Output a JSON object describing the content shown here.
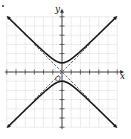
{
  "chart_data": {
    "type": "line",
    "title": "",
    "xlabel": "x",
    "ylabel": "y",
    "origin_label": "O",
    "xlim": [
      -6,
      6
    ],
    "ylim": [
      -6,
      6
    ],
    "grid": true,
    "tick_step": 1,
    "series": [
      {
        "name": "hyperbola upper branch",
        "equation": "y^2 - x^2 = 1",
        "branch": "upper",
        "style": "solid",
        "arrows": true
      },
      {
        "name": "hyperbola lower branch",
        "equation": "y^2 - x^2 = 1",
        "branch": "lower",
        "style": "solid",
        "arrows": true
      },
      {
        "name": "asymptote",
        "equation": "y = x",
        "style": "dashed"
      },
      {
        "name": "asymptote",
        "equation": "y = -x",
        "style": "dashed"
      }
    ],
    "vertices": [
      [
        0,
        1
      ],
      [
        0,
        -1
      ]
    ],
    "colors": {
      "curve": "#1a1a1a",
      "grid": "#d8d8d8",
      "axis": "#333333",
      "asymptote": "#444444"
    }
  }
}
